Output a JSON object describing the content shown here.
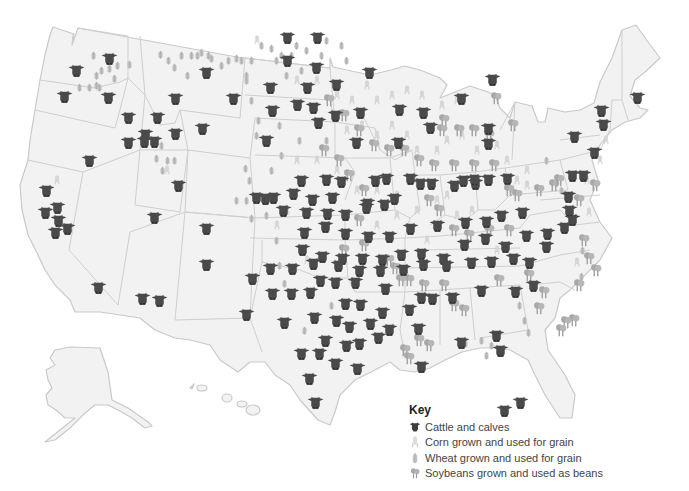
{
  "map": {
    "subject": "United States agriculture: cattle, corn, wheat and soybeans",
    "colors": {
      "land": "#f2f2f2",
      "border": "#c9c9c9",
      "cattle": "#4a4a4a",
      "corn": "#d6d6d6",
      "wheat": "#bdbdbd",
      "soybeans": "#a8a8a8"
    }
  },
  "key": {
    "title": "Key",
    "items": [
      {
        "icon": "cattle-icon",
        "label": "Cattle and calves"
      },
      {
        "icon": "corn-icon",
        "label": "Corn grown and used for grain"
      },
      {
        "icon": "wheat-icon",
        "label": "Wheat grown and used for grain"
      },
      {
        "icon": "soybean-icon",
        "label": "Soybeans grown and used as beans"
      }
    ]
  },
  "markers": {
    "cattle": [
      [
        76,
        70
      ],
      [
        109,
        58
      ],
      [
        64,
        96
      ],
      [
        108,
        97
      ],
      [
        206,
        72
      ],
      [
        175,
        98
      ],
      [
        233,
        98
      ],
      [
        128,
        117
      ],
      [
        145,
        134
      ],
      [
        157,
        117
      ],
      [
        175,
        133
      ],
      [
        128,
        142
      ],
      [
        144,
        141
      ],
      [
        154,
        141
      ],
      [
        202,
        128
      ],
      [
        89,
        160
      ],
      [
        178,
        185
      ],
      [
        46,
        190
      ],
      [
        45,
        212
      ],
      [
        57,
        207
      ],
      [
        58,
        220
      ],
      [
        67,
        228
      ],
      [
        55,
        232
      ],
      [
        154,
        217
      ],
      [
        206,
        228
      ],
      [
        206,
        264
      ],
      [
        98,
        287
      ],
      [
        142,
        298
      ],
      [
        159,
        300
      ],
      [
        246,
        314
      ],
      [
        287,
        37
      ],
      [
        317,
        37
      ],
      [
        287,
        60
      ],
      [
        316,
        67
      ],
      [
        270,
        87
      ],
      [
        307,
        87
      ],
      [
        272,
        110
      ],
      [
        297,
        104
      ],
      [
        313,
        107
      ],
      [
        318,
        122
      ],
      [
        266,
        140
      ],
      [
        336,
        84
      ],
      [
        369,
        72
      ],
      [
        360,
        112
      ],
      [
        335,
        115
      ],
      [
        356,
        142
      ],
      [
        399,
        109
      ],
      [
        398,
        142
      ],
      [
        423,
        112
      ],
      [
        430,
        127
      ],
      [
        488,
        143
      ],
      [
        488,
        128
      ],
      [
        475,
        183
      ],
      [
        454,
        185
      ],
      [
        461,
        98
      ],
      [
        492,
        79
      ],
      [
        256,
        197
      ],
      [
        265,
        198
      ],
      [
        273,
        197
      ],
      [
        293,
        193
      ],
      [
        301,
        180
      ],
      [
        312,
        199
      ],
      [
        332,
        197
      ],
      [
        326,
        179
      ],
      [
        341,
        181
      ],
      [
        375,
        180
      ],
      [
        386,
        178
      ],
      [
        394,
        198
      ],
      [
        367,
        203
      ],
      [
        384,
        204
      ],
      [
        410,
        178
      ],
      [
        420,
        183
      ],
      [
        431,
        183
      ],
      [
        463,
        180
      ],
      [
        474,
        179
      ],
      [
        488,
        179
      ],
      [
        507,
        178
      ],
      [
        283,
        210
      ],
      [
        306,
        212
      ],
      [
        327,
        213
      ],
      [
        345,
        214
      ],
      [
        366,
        207
      ],
      [
        304,
        232
      ],
      [
        325,
        226
      ],
      [
        345,
        233
      ],
      [
        368,
        236
      ],
      [
        389,
        236
      ],
      [
        410,
        228
      ],
      [
        437,
        225
      ],
      [
        465,
        222
      ],
      [
        486,
        221
      ],
      [
        501,
        215
      ],
      [
        522,
        212
      ],
      [
        302,
        249
      ],
      [
        322,
        256
      ],
      [
        342,
        258
      ],
      [
        362,
        258
      ],
      [
        382,
        259
      ],
      [
        401,
        254
      ],
      [
        421,
        253
      ],
      [
        443,
        258
      ],
      [
        464,
        244
      ],
      [
        485,
        238
      ],
      [
        505,
        246
      ],
      [
        526,
        235
      ],
      [
        547,
        233
      ],
      [
        564,
        227
      ],
      [
        572,
        219
      ],
      [
        572,
        175
      ],
      [
        583,
        175
      ],
      [
        568,
        196
      ],
      [
        569,
        210
      ],
      [
        270,
        268
      ],
      [
        292,
        268
      ],
      [
        313,
        263
      ],
      [
        338,
        265
      ],
      [
        359,
        270
      ],
      [
        380,
        270
      ],
      [
        403,
        269
      ],
      [
        423,
        264
      ],
      [
        446,
        265
      ],
      [
        471,
        262
      ],
      [
        491,
        261
      ],
      [
        513,
        258
      ],
      [
        529,
        262
      ],
      [
        546,
        246
      ],
      [
        533,
        285
      ],
      [
        515,
        291
      ],
      [
        481,
        290
      ],
      [
        496,
        335
      ],
      [
        252,
        278
      ],
      [
        272,
        293
      ],
      [
        291,
        293
      ],
      [
        310,
        292
      ],
      [
        320,
        280
      ],
      [
        335,
        282
      ],
      [
        355,
        282
      ],
      [
        385,
        288
      ],
      [
        382,
        312
      ],
      [
        360,
        304
      ],
      [
        345,
        303
      ],
      [
        336,
        320
      ],
      [
        314,
        317
      ],
      [
        284,
        322
      ],
      [
        349,
        326
      ],
      [
        370,
        323
      ],
      [
        389,
        329
      ],
      [
        418,
        328
      ],
      [
        432,
        298
      ],
      [
        452,
        297
      ],
      [
        500,
        350
      ],
      [
        504,
        410
      ],
      [
        520,
        402
      ],
      [
        301,
        353
      ],
      [
        319,
        353
      ],
      [
        309,
        378
      ],
      [
        315,
        402
      ],
      [
        378,
        337
      ],
      [
        359,
        343
      ],
      [
        346,
        345
      ],
      [
        357,
        368
      ],
      [
        335,
        363
      ],
      [
        325,
        340
      ],
      [
        409,
        309
      ],
      [
        421,
        366
      ],
      [
        421,
        297
      ],
      [
        461,
        342
      ],
      [
        601,
        110
      ],
      [
        637,
        97
      ],
      [
        574,
        136
      ],
      [
        603,
        124
      ],
      [
        594,
        152
      ]
    ],
    "corn": [
      [
        300,
        80
      ],
      [
        320,
        80
      ],
      [
        340,
        95
      ],
      [
        355,
        100
      ],
      [
        370,
        85
      ],
      [
        380,
        100
      ],
      [
        395,
        95
      ],
      [
        410,
        90
      ],
      [
        425,
        95
      ],
      [
        445,
        105
      ],
      [
        460,
        100
      ],
      [
        350,
        130
      ],
      [
        365,
        125
      ],
      [
        380,
        135
      ],
      [
        395,
        125
      ],
      [
        410,
        135
      ],
      [
        420,
        150
      ],
      [
        440,
        150
      ],
      [
        450,
        140
      ],
      [
        465,
        135
      ],
      [
        480,
        150
      ],
      [
        500,
        145
      ],
      [
        510,
        160
      ],
      [
        520,
        180
      ],
      [
        530,
        185
      ],
      [
        450,
        195
      ],
      [
        400,
        195
      ],
      [
        380,
        190
      ],
      [
        360,
        190
      ],
      [
        340,
        170
      ],
      [
        320,
        160
      ],
      [
        300,
        160
      ],
      [
        290,
        210
      ],
      [
        280,
        225
      ],
      [
        460,
        215
      ],
      [
        475,
        210
      ],
      [
        530,
        170
      ],
      [
        590,
        180
      ],
      [
        603,
        160
      ],
      [
        609,
        140
      ],
      [
        592,
        212
      ],
      [
        380,
        225
      ],
      [
        400,
        215
      ],
      [
        420,
        210
      ],
      [
        440,
        200
      ],
      [
        500,
        250
      ],
      [
        580,
        262
      ],
      [
        60,
        180
      ],
      [
        68,
        228
      ],
      [
        170,
        170
      ],
      [
        260,
        40
      ],
      [
        310,
        260
      ],
      [
        430,
        240
      ]
    ],
    "wheat": [
      [
        97,
        55
      ],
      [
        100,
        75
      ],
      [
        105,
        70
      ],
      [
        113,
        68
      ],
      [
        118,
        78
      ],
      [
        121,
        65
      ],
      [
        100,
        85
      ],
      [
        83,
        87
      ],
      [
        93,
        87
      ],
      [
        103,
        87
      ],
      [
        133,
        64
      ],
      [
        164,
        54
      ],
      [
        172,
        60
      ],
      [
        178,
        67
      ],
      [
        185,
        55
      ],
      [
        191,
        75
      ],
      [
        195,
        55
      ],
      [
        201,
        55
      ],
      [
        240,
        58
      ],
      [
        245,
        60
      ],
      [
        250,
        75
      ],
      [
        255,
        60
      ],
      [
        265,
        45
      ],
      [
        275,
        48
      ],
      [
        280,
        60
      ],
      [
        285,
        55
      ],
      [
        290,
        75
      ],
      [
        295,
        55
      ],
      [
        300,
        45
      ],
      [
        310,
        50
      ],
      [
        305,
        70
      ],
      [
        325,
        55
      ],
      [
        330,
        40
      ],
      [
        345,
        45
      ],
      [
        350,
        60
      ],
      [
        250,
        80
      ],
      [
        255,
        100
      ],
      [
        262,
        120
      ],
      [
        283,
        125
      ],
      [
        303,
        140
      ],
      [
        330,
        140
      ],
      [
        285,
        155
      ],
      [
        275,
        170
      ],
      [
        253,
        180
      ],
      [
        270,
        215
      ],
      [
        280,
        240
      ],
      [
        283,
        265
      ],
      [
        288,
        283
      ],
      [
        255,
        218
      ],
      [
        250,
        200
      ],
      [
        249,
        168
      ],
      [
        260,
        135
      ],
      [
        165,
        145
      ],
      [
        171,
        160
      ],
      [
        166,
        170
      ],
      [
        550,
        160
      ],
      [
        560,
        180
      ],
      [
        565,
        190
      ],
      [
        586,
        250
      ],
      [
        585,
        276
      ],
      [
        523,
        305
      ],
      [
        528,
        320
      ],
      [
        532,
        332
      ],
      [
        490,
        355
      ],
      [
        495,
        345
      ],
      [
        485,
        340
      ],
      [
        469,
        343
      ],
      [
        308,
        330
      ],
      [
        335,
        305
      ],
      [
        340,
        280
      ],
      [
        160,
        158
      ],
      [
        178,
        160
      ],
      [
        240,
        200
      ],
      [
        225,
        65
      ],
      [
        232,
        60
      ],
      [
        215,
        58
      ],
      [
        205,
        52
      ],
      [
        212,
        55
      ]
    ],
    "soybeans": [
      [
        330,
        100
      ],
      [
        345,
        115
      ],
      [
        360,
        130
      ],
      [
        375,
        145
      ],
      [
        390,
        150
      ],
      [
        405,
        150
      ],
      [
        420,
        160
      ],
      [
        435,
        165
      ],
      [
        445,
        120
      ],
      [
        460,
        130
      ],
      [
        475,
        130
      ],
      [
        490,
        135
      ],
      [
        510,
        190
      ],
      [
        518,
        195
      ],
      [
        540,
        190
      ],
      [
        555,
        185
      ],
      [
        443,
        130
      ],
      [
        455,
        165
      ],
      [
        475,
        165
      ],
      [
        495,
        165
      ],
      [
        430,
        200
      ],
      [
        440,
        210
      ],
      [
        455,
        230
      ],
      [
        470,
        235
      ],
      [
        490,
        230
      ],
      [
        510,
        230
      ],
      [
        390,
        260
      ],
      [
        410,
        280
      ],
      [
        425,
        285
      ],
      [
        445,
        285
      ],
      [
        455,
        305
      ],
      [
        465,
        310
      ],
      [
        420,
        340
      ],
      [
        430,
        345
      ],
      [
        406,
        350
      ],
      [
        410,
        358
      ],
      [
        396,
        268
      ],
      [
        402,
        280
      ],
      [
        590,
        258
      ],
      [
        597,
        270
      ],
      [
        585,
        240
      ],
      [
        580,
        285
      ],
      [
        575,
        320
      ],
      [
        567,
        322
      ],
      [
        562,
        330
      ],
      [
        540,
        308
      ],
      [
        545,
        292
      ],
      [
        580,
        200
      ],
      [
        560,
        180
      ],
      [
        596,
        185
      ],
      [
        325,
        150
      ],
      [
        340,
        160
      ],
      [
        350,
        175
      ],
      [
        365,
        190
      ],
      [
        360,
        220
      ],
      [
        345,
        250
      ],
      [
        365,
        245
      ],
      [
        500,
        280
      ],
      [
        530,
        275
      ],
      [
        514,
        125
      ],
      [
        497,
        98
      ]
    ]
  }
}
